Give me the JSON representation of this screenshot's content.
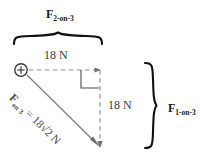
{
  "figure": {
    "type": "force-vector-diagram",
    "background": "#ffffff",
    "ink": "#1a1a1a",
    "dash_color": "#8c8c8c",
    "diagonal_color": "#7a7a7a",
    "labels": {
      "top_force_symbol": "F",
      "top_force_subscript": "2-on-3",
      "top_magnitude": "18 N",
      "right_magnitude": "18 N",
      "right_force_symbol": "F",
      "right_force_subscript": "1-on-3",
      "diagonal_symbol": "F",
      "diagonal_subscript": "on 3",
      "diagonal_equals": " = 18",
      "diagonal_radical": "√",
      "diagonal_rest": "2 N"
    },
    "geometry": {
      "origin_x": 21,
      "origin_y": 70,
      "corner_x": 100,
      "corner_y": 70,
      "end_x": 100,
      "end_y": 147,
      "horizontal_value": 18,
      "vertical_value": 18,
      "resultant_value": "18√2",
      "units": "N",
      "right_angle_marker": true
    }
  }
}
